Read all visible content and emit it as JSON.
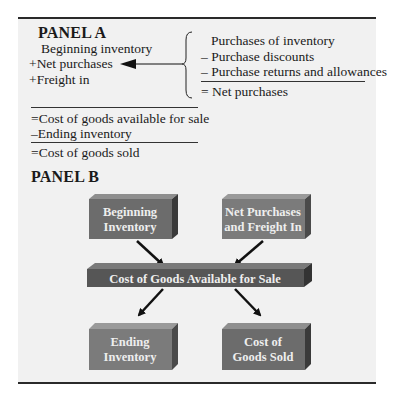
{
  "panel_a": {
    "title": "PANEL A",
    "left_lines": [
      {
        "op": "",
        "text": "Beginning inventory"
      },
      {
        "op": "+",
        "text": "Net purchases"
      },
      {
        "op": "+",
        "text": "Freight in"
      }
    ],
    "right_lines": [
      {
        "op": "",
        "text": "Purchases of inventory"
      },
      {
        "op": "–",
        "text": "Purchase discounts"
      },
      {
        "op": "–",
        "text": "Purchase returns and allowances"
      },
      {
        "op": "=",
        "text": "Net purchases"
      }
    ],
    "bottom_lines": [
      {
        "op": "=",
        "text": "Cost of goods available for sale"
      },
      {
        "op": "–",
        "text": "Ending inventory"
      },
      {
        "op": "=",
        "text": "Cost of goods sold"
      }
    ]
  },
  "panel_b": {
    "title": "PANEL B",
    "boxes": {
      "beginning": [
        "Beginning",
        "Inventory"
      ],
      "net_purchases": [
        "Net Purchases",
        "and Freight In"
      ],
      "available": "Cost of Goods Available for Sale",
      "ending": [
        "Ending",
        "Inventory"
      ],
      "cogs": [
        "Cost of",
        "Goods Sold"
      ]
    }
  },
  "colors": {
    "panel_bg": "#f1f1f1",
    "box_front": "#5d5d5d",
    "box_front_light": "#7b7b7b",
    "box_top": "#8f8f8f",
    "box_side": "#3a3a3a",
    "text_light": "#eeeeee"
  }
}
